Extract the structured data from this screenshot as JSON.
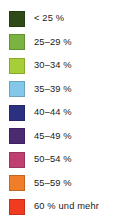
{
  "legend": {
    "title": "",
    "items": [
      {
        "label": "< 25 %",
        "color": "#2d4a18",
        "range_min": null,
        "range_max": 25
      },
      {
        "label": "25–29 %",
        "color": "#7ab342",
        "range_min": 25,
        "range_max": 29
      },
      {
        "label": "30–34 %",
        "color": "#a6ce39",
        "range_min": 30,
        "range_max": 34
      },
      {
        "label": "35–39 %",
        "color": "#84c7e8",
        "range_min": 35,
        "range_max": 39
      },
      {
        "label": "40–44 %",
        "color": "#2b3180",
        "range_min": 40,
        "range_max": 44
      },
      {
        "label": "45–49 %",
        "color": "#4b2a72",
        "range_min": 45,
        "range_max": 49
      },
      {
        "label": "50–54 %",
        "color": "#bf4070",
        "range_min": 50,
        "range_max": 54
      },
      {
        "label": "55–59 %",
        "color": "#f07d28",
        "range_min": 55,
        "range_max": 59
      },
      {
        "label": "60 % und mehr",
        "color": "#ef3b1f",
        "range_min": 60,
        "range_max": null
      }
    ]
  },
  "chart_data": {
    "type": "table",
    "title": "",
    "categories": [
      "< 25 %",
      "25–29 %",
      "30–34 %",
      "35–39 %",
      "40–44 %",
      "45–49 %",
      "50–54 %",
      "55–59 %",
      "60 % und mehr"
    ],
    "colors": [
      "#2d4a18",
      "#7ab342",
      "#a6ce39",
      "#84c7e8",
      "#2b3180",
      "#4b2a72",
      "#bf4070",
      "#f07d28",
      "#ef3b1f"
    ],
    "legend_position": "standalone",
    "grid": false
  }
}
